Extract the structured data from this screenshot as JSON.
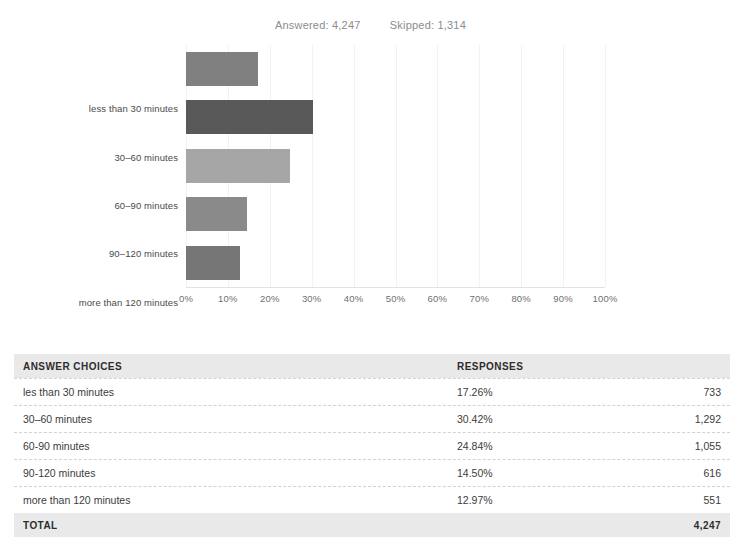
{
  "summary": {
    "answered_label": "Answered: 4,247",
    "skipped_label": "Skipped: 1,314",
    "answered": 4247,
    "skipped": 1314
  },
  "chart_data": {
    "type": "bar",
    "orientation": "horizontal",
    "title": "",
    "subtitle": "",
    "xlabel": "",
    "ylabel": "",
    "xlim": [
      0,
      100
    ],
    "grid": true,
    "legend": "none",
    "categories": [
      "less than 30 minutes",
      "30–60 minutes",
      "60–90 minutes",
      "90–120 minutes",
      "more than 120 minutes"
    ],
    "values": [
      17.26,
      30.42,
      24.84,
      14.5,
      12.97
    ],
    "counts": [
      733,
      1292,
      1055,
      616,
      551
    ],
    "bar_colors": [
      "#808080",
      "#595959",
      "#a6a6a6",
      "#8a8a8a",
      "#767676"
    ],
    "xticks": [
      "0%",
      "10%",
      "20%",
      "30%",
      "40%",
      "50%",
      "60%",
      "70%",
      "80%",
      "90%",
      "100%"
    ],
    "xtick_values": [
      0,
      10,
      20,
      30,
      40,
      50,
      60,
      70,
      80,
      90,
      100
    ]
  },
  "table": {
    "headers": {
      "choices": "ANSWER CHOICES",
      "responses": "RESPONSES",
      "count": ""
    },
    "rows": [
      {
        "choice": "les than 30 minutes",
        "pct": "17.26%",
        "count": "733"
      },
      {
        "choice": "30–60 minutes",
        "pct": "30.42%",
        "count": "1,292"
      },
      {
        "choice": "60-90 minutes",
        "pct": "24.84%",
        "count": "1,055"
      },
      {
        "choice": "90-120 minutes",
        "pct": "14.50%",
        "count": "616"
      },
      {
        "choice": "more than 120 minutes",
        "pct": "12.97%",
        "count": "551"
      }
    ],
    "total": {
      "label": "TOTAL",
      "pct": "",
      "count": "4,247"
    }
  },
  "colors": {
    "page_background": "#ffffff",
    "header_band": "#e9e9e9",
    "text": "#3c3c3c",
    "muted_text": "#8c8c8c",
    "gridline": "#f2f2f2",
    "row_divider": "#d2d2d2"
  }
}
